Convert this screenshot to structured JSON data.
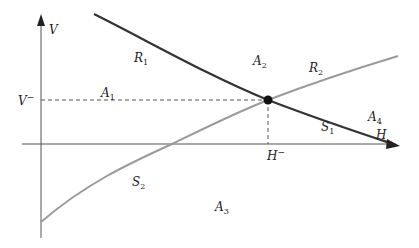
{
  "diagram": {
    "axes": {
      "x_label": "H",
      "y_label": "V",
      "x_tick_label": "H",
      "x_tick_sup": "−",
      "y_tick_label": "V",
      "y_tick_sup": "−"
    },
    "curves": [
      {
        "name": "R1-S1",
        "color": "#333333",
        "labels": [
          "R",
          "S"
        ],
        "subs": [
          "1",
          "1"
        ]
      },
      {
        "name": "R2-S2",
        "color": "#999999",
        "labels": [
          "R",
          "S"
        ],
        "subs": [
          "2",
          "2"
        ]
      }
    ],
    "regions": [
      {
        "label": "A",
        "sub": "1"
      },
      {
        "label": "A",
        "sub": "2"
      },
      {
        "label": "A",
        "sub": "3"
      },
      {
        "label": "A",
        "sub": "4"
      }
    ],
    "colors": {
      "axis": "#555555",
      "curve_dark": "#333333",
      "curve_light": "#9a9a9a",
      "dashed": "#555555",
      "point": "#111111"
    },
    "equilibrium_point": {
      "x": 268,
      "y": 100
    }
  }
}
